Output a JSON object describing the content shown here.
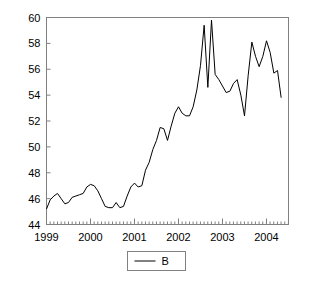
{
  "chart_data": {
    "type": "line",
    "title": "",
    "xlabel": "",
    "ylabel": "",
    "ylim": [
      44,
      60
    ],
    "xlim": [
      1999.0,
      2004.5
    ],
    "grid": false,
    "legend_position": "bottom-center",
    "yticks": [
      44,
      46,
      48,
      50,
      52,
      54,
      56,
      58,
      60
    ],
    "ytick_labels": [
      "44",
      "46",
      "48",
      "50",
      "52",
      "54",
      "56",
      "58",
      "60"
    ],
    "xticks": [
      1999,
      2000,
      2001,
      2002,
      2003,
      2004
    ],
    "xtick_labels": [
      "1999",
      "2000",
      "2001",
      "2002",
      "2003",
      "2004"
    ],
    "minor_tick_interval": 0.0833,
    "series": [
      {
        "name": "B",
        "color": "#000000",
        "x": [
          1999.0,
          1999.083,
          1999.167,
          1999.25,
          1999.333,
          1999.417,
          1999.5,
          1999.583,
          1999.667,
          1999.75,
          1999.833,
          1999.917,
          2000.0,
          2000.083,
          2000.167,
          2000.25,
          2000.333,
          2000.417,
          2000.5,
          2000.583,
          2000.667,
          2000.75,
          2000.833,
          2000.917,
          2001.0,
          2001.083,
          2001.167,
          2001.25,
          2001.333,
          2001.417,
          2001.5,
          2001.583,
          2001.667,
          2001.75,
          2001.833,
          2001.917,
          2002.0,
          2002.083,
          2002.167,
          2002.25,
          2002.333,
          2002.417,
          2002.5,
          2002.583,
          2002.667,
          2002.75,
          2002.833,
          2002.917,
          2003.0,
          2003.083,
          2003.167,
          2003.25,
          2003.333,
          2003.417,
          2003.5,
          2003.583,
          2003.667,
          2003.75,
          2003.833,
          2003.917,
          2004.0,
          2004.083,
          2004.167,
          2004.25,
          2004.333
        ],
        "values": [
          45.2,
          45.9,
          46.2,
          46.4,
          46.0,
          45.6,
          45.7,
          46.1,
          46.2,
          46.3,
          46.4,
          46.9,
          47.1,
          47.0,
          46.6,
          46.0,
          45.4,
          45.3,
          45.3,
          45.7,
          45.3,
          45.4,
          46.2,
          46.9,
          47.2,
          46.9,
          47.0,
          48.2,
          48.8,
          49.8,
          50.5,
          51.5,
          51.4,
          50.5,
          51.6,
          52.6,
          53.1,
          52.6,
          52.4,
          52.4,
          53.1,
          54.4,
          56.3,
          59.4,
          54.6,
          59.8,
          55.6,
          55.2,
          54.7,
          54.2,
          54.3,
          54.9,
          55.2,
          54.0,
          52.4,
          55.5,
          58.1,
          57.0,
          56.2,
          57.0,
          58.2,
          57.3,
          55.7,
          55.9,
          53.8
        ]
      }
    ]
  },
  "legend": {
    "entries": [
      {
        "label": "B",
        "line_color": "#000000"
      }
    ]
  },
  "frame": {
    "border_color": "#808080",
    "plot_bg": "#ffffff"
  }
}
